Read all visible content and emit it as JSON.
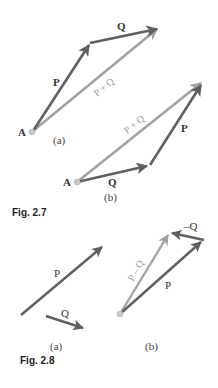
{
  "colors": {
    "component_vector": "#5f5f64",
    "resultant_vector": "#a3a3a6",
    "origin_point": "#c8c8c8",
    "text": "#333333"
  },
  "figures": [
    {
      "caption": "Fig. 2.7",
      "panels": [
        {
          "sub_label": "(a)",
          "origin_label": "A",
          "vectors": [
            {
              "name": "P",
              "label": "P",
              "kind": "component"
            },
            {
              "name": "Q",
              "label": "Q",
              "kind": "component"
            },
            {
              "name": "P+Q",
              "label": "P + Q",
              "kind": "resultant"
            }
          ]
        },
        {
          "sub_label": "(b)",
          "origin_label": "A",
          "vectors": [
            {
              "name": "Q",
              "label": "Q",
              "kind": "component"
            },
            {
              "name": "P",
              "label": "P",
              "kind": "component"
            },
            {
              "name": "P+Q",
              "label": "P + Q",
              "kind": "resultant"
            }
          ]
        }
      ]
    },
    {
      "caption": "Fig. 2.8",
      "panels": [
        {
          "sub_label": "(a)",
          "vectors": [
            {
              "name": "P",
              "label": "P",
              "kind": "component"
            },
            {
              "name": "Q",
              "label": "Q",
              "kind": "component"
            }
          ]
        },
        {
          "sub_label": "(b)",
          "vectors": [
            {
              "name": "P",
              "label": "P",
              "kind": "component"
            },
            {
              "name": "-Q",
              "label": "–Q",
              "kind": "component"
            },
            {
              "name": "P-Q",
              "label": "P – Q",
              "kind": "resultant"
            }
          ]
        }
      ]
    }
  ]
}
